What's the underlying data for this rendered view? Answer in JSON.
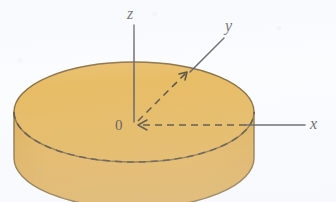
{
  "figure": {
    "kind": "3d-cylinder-coordinate-axes",
    "caption_text": "",
    "background_color": "#fbfcfe",
    "labels": {
      "z_axis": "z",
      "y_axis": "y",
      "x_axis": "x",
      "origin": "0"
    },
    "colors": {
      "top_face_outer": "#e0a838",
      "top_face_inner": "#ecd79c",
      "side_wall": "#dfa336",
      "side_wall_shadow": "#cf9429",
      "outline": "#6b4a11",
      "axis_line": "#3a3a40",
      "dashed_line": "#2e2414",
      "label_text": "#2b2b30"
    },
    "geometry": {
      "ellipse_center_x": 134,
      "ellipse_center_y": 112,
      "ellipse_rx": 120,
      "ellipse_ry": 50,
      "cylinder_height": 46,
      "z_axis_top_y": 25,
      "x_axis_end_x": 305,
      "x_axis_y": 125
    },
    "label_positions": {
      "z": {
        "x": 127,
        "y": 6
      },
      "y": {
        "x": 225,
        "y": 18
      },
      "x": {
        "x": 310,
        "y": 116
      },
      "origin": {
        "x": 115,
        "y": 118
      }
    },
    "elements": {
      "z_axis_name": "vertical-axis",
      "y_axis_name": "depth-axis-dashed",
      "x_axis_name": "horizontal-axis",
      "solid_rim_name": "top-face-rim",
      "dashed_rim_name": "hidden-equator-dashed",
      "leader_name": "y-label-leader-line"
    }
  }
}
